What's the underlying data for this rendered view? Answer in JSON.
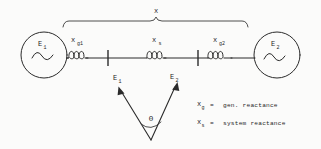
{
  "figure": {
    "type": "circuit-diagram",
    "title": "",
    "background_color": "#fbfbfa",
    "ink_color": "#2b2b2b"
  },
  "brace": {
    "label": "x",
    "span_start_x": 62,
    "span_end_x": 248
  },
  "sources": [
    {
      "name": "generator-left",
      "label": "E",
      "subscript": "1",
      "symbol": "sine-wave",
      "cx": 44,
      "cy": 55,
      "r": 23
    },
    {
      "name": "generator-right",
      "label": "E",
      "subscript": "2",
      "symbol": "sine-wave",
      "cx": 277,
      "cy": 55,
      "r": 23
    }
  ],
  "reactances": [
    {
      "name": "reactance-g1",
      "label": "x",
      "subscript": "g1",
      "cx": 76,
      "cy": 58
    },
    {
      "name": "reactance-s",
      "label": "x",
      "subscript": "s",
      "cx": 157,
      "cy": 58
    },
    {
      "name": "reactance-g2",
      "label": "x",
      "subscript": "g2",
      "cx": 218,
      "cy": 58
    }
  ],
  "buses": [
    {
      "name": "bus-left",
      "x": 108,
      "y1": 50,
      "y2": 66
    },
    {
      "name": "bus-right",
      "x": 198,
      "y1": 50,
      "y2": 66
    }
  ],
  "phasor_diagram": {
    "name": "phasor-diagram",
    "vertex_x": 151,
    "vertex_y": 140,
    "angle_label": "Θ",
    "phasors": [
      {
        "name": "phasor-e1",
        "label": "E",
        "subscript": "1",
        "tip_x": 119,
        "tip_y": 88
      },
      {
        "name": "phasor-e2",
        "label": "E",
        "subscript": "2",
        "tip_x": 177,
        "tip_y": 84
      }
    ]
  },
  "legend": {
    "rows": [
      {
        "symbol": "x",
        "subscript": "g",
        "equals": "=",
        "description": "gen. reactance"
      },
      {
        "symbol": "x",
        "subscript": "s",
        "equals": "=",
        "description": "system reactance"
      }
    ]
  }
}
